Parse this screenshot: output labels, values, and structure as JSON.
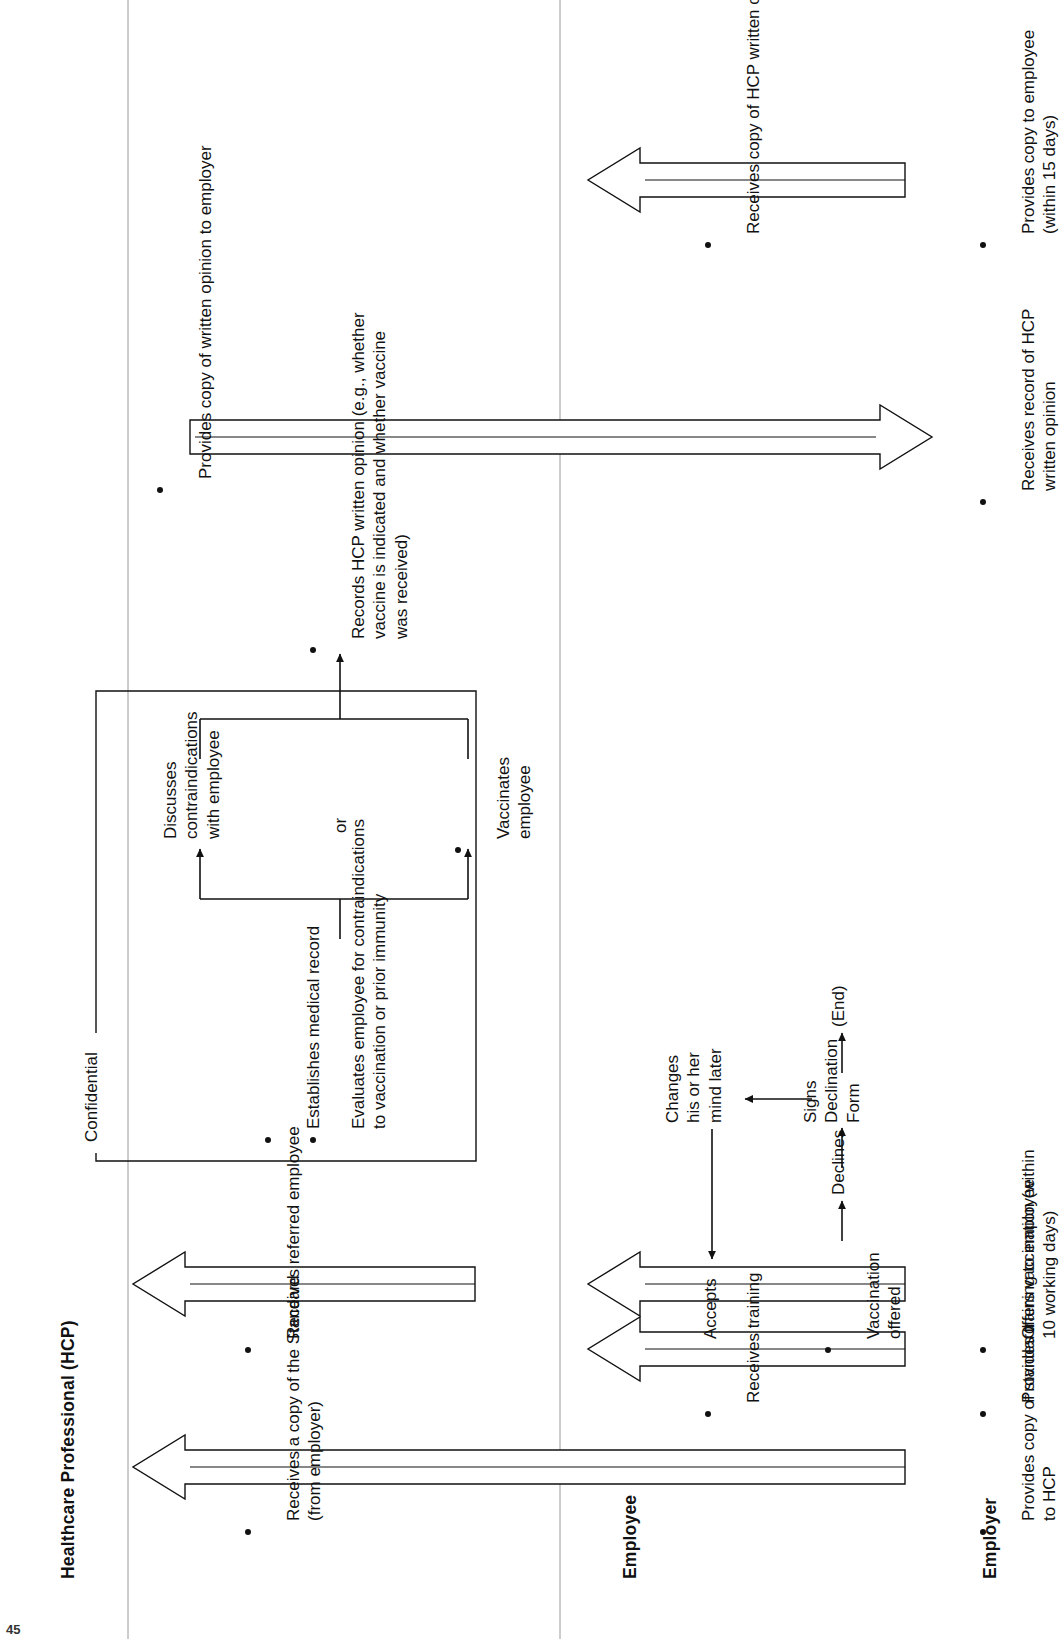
{
  "document": {
    "type": "swimlane-flowchart",
    "subject": "Hepatitis B vaccination / bloodborne pathogens standard process flow",
    "page_number": "45"
  },
  "lanes": [
    {
      "id": "employer",
      "title": "Employer",
      "steps": [
        {
          "id": "emp-1",
          "bullet": true,
          "text": "Provides copy of standard\nto HCP"
        },
        {
          "id": "emp-2",
          "bullet": true,
          "text": "Provides training to employee"
        },
        {
          "id": "emp-3",
          "bullet": true,
          "text": "Offers vaccination (within\n10 working days)"
        },
        {
          "id": "emp-4",
          "bullet": true,
          "text": "Receives record of HCP\nwritten opinion"
        },
        {
          "id": "emp-5",
          "bullet": true,
          "text": "Provides copy to employee\n(within 15 days)"
        }
      ]
    },
    {
      "id": "employee",
      "title": "Employee",
      "steps": [
        {
          "id": "ee-1",
          "bullet": true,
          "text": "Receives training"
        },
        {
          "id": "ee-2",
          "bullet": true,
          "text": "Vaccination\noffered"
        },
        {
          "id": "ee-3",
          "bullet": false,
          "text": "Accepts"
        },
        {
          "id": "ee-4",
          "bullet": false,
          "text": "Declines"
        },
        {
          "id": "ee-5",
          "bullet": false,
          "text": "Signs\nDeclination\nForm"
        },
        {
          "id": "ee-6",
          "bullet": false,
          "text": "(End)"
        },
        {
          "id": "ee-7",
          "bullet": false,
          "text": "Changes\nhis or her\nmind later"
        },
        {
          "id": "ee-8",
          "bullet": true,
          "text": "Receives copy of HCP written opinion"
        }
      ]
    },
    {
      "id": "hcp",
      "title": "Healthcare Professional (HCP)",
      "steps": [
        {
          "id": "hcp-1",
          "bullet": true,
          "text": "Receives a copy of the Standard\n(from employer)"
        },
        {
          "id": "hcp-2",
          "bullet": true,
          "text": "Receives referred employee"
        },
        {
          "id": "hcp-3",
          "bullet": true,
          "text": "Establishes medical record"
        },
        {
          "id": "hcp-4",
          "bullet": true,
          "text": "Evaluates employee for contraindications\nto vaccination or prior immunity"
        },
        {
          "id": "hcp-5",
          "bullet": true,
          "text": "Vaccinates\nemployee"
        },
        {
          "id": "hcp-6",
          "bullet": false,
          "text": "or"
        },
        {
          "id": "hcp-7",
          "bullet": false,
          "text": "Discusses\ncontraindications\nwith employee"
        },
        {
          "id": "hcp-8",
          "bullet": true,
          "text": "Records HCP written opinion (e.g., whether\nvaccine is indicated and whether vaccine\nwas received)"
        },
        {
          "id": "hcp-9",
          "bullet": true,
          "text": "Provides copy of written opinion to employer"
        }
      ]
    }
  ],
  "groups": [
    {
      "id": "confidential-box",
      "label": "Confidential"
    }
  ],
  "colors": {
    "ink": "#111111",
    "rule": "#9a9a9a",
    "paper": "#ffffff"
  }
}
